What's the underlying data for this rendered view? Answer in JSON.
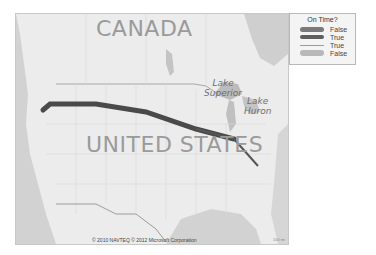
{
  "map": {
    "country_labels": [
      "CANADA",
      "UNITED STATES"
    ],
    "lake_labels": [
      {
        "line1": "Lake",
        "line2": "Superior"
      },
      {
        "line1": "Lake",
        "line2": "Huron"
      }
    ],
    "copyright": "© 2010 NAVTEQ  © 2012 Microsoft Corporation",
    "scale_text": "100 mi",
    "routes": [
      {
        "on_time": "False",
        "color": "#4a4a4a",
        "width": 5
      },
      {
        "on_time": "True",
        "color": "#555555",
        "width": 2
      }
    ]
  },
  "legend": {
    "title": "On Time?",
    "items": [
      {
        "label": "False",
        "color": "#7a7a7a",
        "thickness": 5
      },
      {
        "label": "True",
        "color": "#5f5f5f",
        "thickness": 4
      },
      {
        "label": "True",
        "color": "#9a9a9a",
        "thickness": 1
      },
      {
        "label": "False",
        "color": "#b8b8b8",
        "thickness": 6
      }
    ]
  }
}
